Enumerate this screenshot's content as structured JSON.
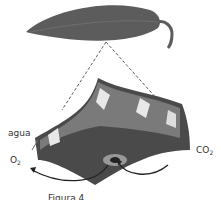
{
  "diagram": {
    "labels": {
      "water": "agua",
      "oxygen": "O",
      "oxygen_sub": "2",
      "co2": "CO",
      "co2_sub": "2",
      "caption": "Figura 4"
    },
    "colors": {
      "leaf": "#5a5a5a",
      "tissue_dark": "#4a4a4a",
      "tissue_mid": "#7a7a7a",
      "tissue_light": "#e8e8e8"
    }
  }
}
